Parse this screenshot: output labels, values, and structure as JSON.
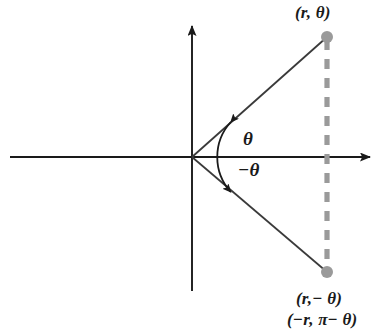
{
  "figure": {
    "type": "polar-coordinate-diagram",
    "background_color": "#ffffff",
    "axis_color": "#1a1a1a",
    "ray_color": "#3a3a3a",
    "accent_color": "#999999"
  },
  "labels": {
    "point_upper": "(r, θ)",
    "point_lower_primary": "(r,− θ)",
    "point_lower_secondary": "(−r, π− θ)",
    "angle_positive": "θ",
    "angle_negative": "−θ"
  },
  "geometry": {
    "origin": {
      "x": 192,
      "y": 157
    },
    "x_axis": {
      "x_start": 10,
      "x_end": 376,
      "y": 157,
      "arrow": "right"
    },
    "y_axis": {
      "x": 192,
      "y_start": 20,
      "y_end": 291,
      "arrow": "up"
    },
    "point_upper": {
      "x": 327,
      "y": 37
    },
    "point_lower": {
      "x": 327,
      "y": 272
    },
    "dot_radius": 6,
    "dashed_connector": {
      "x": 327,
      "y_start": 37,
      "y_end": 272
    },
    "angle_arc_radius": 52,
    "angle_arc_arrows": "double-headed"
  }
}
